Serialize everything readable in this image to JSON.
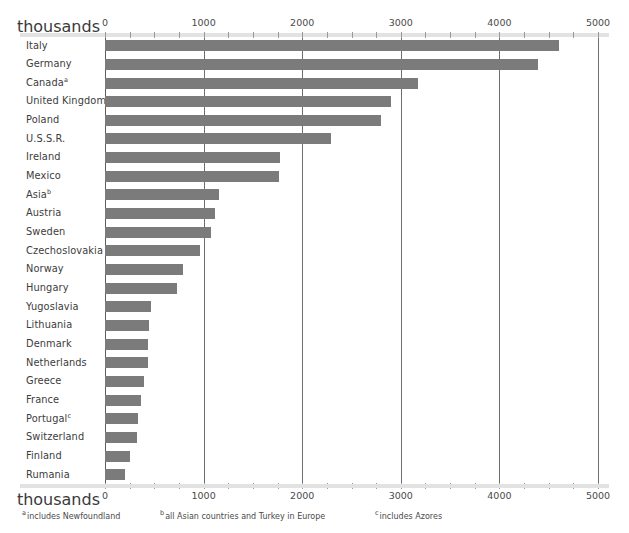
{
  "axis": {
    "unit_label": "thousands",
    "tick_labels": [
      "0",
      "1000",
      "2000",
      "3000",
      "4000",
      "5000"
    ]
  },
  "footnotes": [
    {
      "marker": "a",
      "text": "includes Newfoundland"
    },
    {
      "marker": "b",
      "text": "all Asian countries and Turkey in Europe"
    },
    {
      "marker": "c",
      "text": "includes Azores"
    }
  ],
  "colors": {
    "bar": "#7b7b7b",
    "gridline": "#6f6f6f",
    "rule": "#e2e2e2",
    "text": "#3c3c3c",
    "background": "#ffffff"
  },
  "chart_data": {
    "type": "bar",
    "orientation": "horizontal",
    "title": "",
    "xlabel": "thousands",
    "ylabel": "",
    "xlim": [
      0,
      5000
    ],
    "xticks": [
      0,
      1000,
      2000,
      3000,
      4000,
      5000
    ],
    "minor_tick_step": 250,
    "grid": true,
    "legend": "none",
    "categories": [
      "Italy",
      "Germany",
      "Canada",
      "United Kingdom",
      "Poland",
      "U.S.S.R.",
      "Ireland",
      "Mexico",
      "Asia",
      "Austria",
      "Sweden",
      "Czechoslovakia",
      "Norway",
      "Hungary",
      "Yugoslavia",
      "Lithuania",
      "Denmark",
      "Netherlands",
      "Greece",
      "France",
      "Portugal",
      "Switzerland",
      "Finland",
      "Rumania"
    ],
    "category_markers": {
      "Canada": "a",
      "Asia": "b",
      "Portugal": "c"
    },
    "values": [
      4605,
      4390,
      3175,
      2900,
      2800,
      2290,
      1775,
      1760,
      1160,
      1115,
      1075,
      965,
      790,
      735,
      470,
      445,
      440,
      435,
      395,
      370,
      330,
      320,
      250,
      205
    ]
  }
}
